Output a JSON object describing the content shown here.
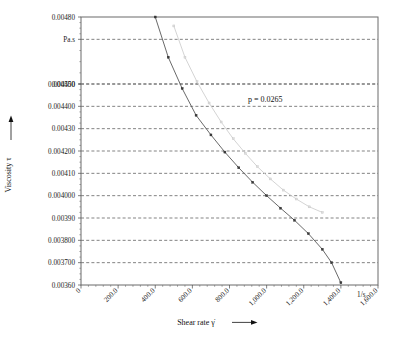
{
  "chart_data": {
    "type": "scatter",
    "title": "",
    "xlabel": "Shear rate γ̇",
    "ylabel": "Viscosity τ",
    "x_unit": "1/s",
    "y_unit": "Pa.s",
    "xlim": [
      0,
      1600
    ],
    "ylim": [
      0.0036,
      0.0048
    ],
    "grid": true,
    "legend": "none",
    "x_ticks": [
      0,
      200,
      400,
      600,
      800,
      1000,
      1200,
      1400,
      1600
    ],
    "x_tick_labels": [
      "0",
      "200.0",
      "400.0",
      "600.0",
      "800.0",
      "1,000.0",
      "1,200.0",
      "1,400.0",
      "1,600.0"
    ],
    "y_ticks": [
      0.0048,
      0.0047,
      0.0045,
      0.0045,
      0.0044,
      0.0043,
      0.0042,
      0.0041,
      0.004,
      0.0039,
      0.0038,
      0.0037,
      0.0036
    ],
    "y_tick_labels": [
      "0.00480",
      "Pa.s",
      "0.004500",
      "0.00450",
      "0.004400",
      "0.00430",
      "0.004200",
      "0.00410",
      "0.004000",
      "0.00390",
      "0.003800",
      "0.003700",
      "0.00360"
    ],
    "annotations": [
      {
        "text": "p = 0.0265",
        "x": 900,
        "y": 0.00442
      }
    ],
    "series": [
      {
        "name": "down-ramp",
        "color": "#585858",
        "marker": "filled-square",
        "points": [
          {
            "x": 400,
            "y": 0.0048
          },
          {
            "x": 470,
            "y": 0.00462
          },
          {
            "x": 545,
            "y": 0.00448
          },
          {
            "x": 620,
            "y": 0.00436
          },
          {
            "x": 700,
            "y": 0.004272
          },
          {
            "x": 775,
            "y": 0.004195
          },
          {
            "x": 850,
            "y": 0.004125
          },
          {
            "x": 925,
            "y": 0.00406
          },
          {
            "x": 1000,
            "y": 0.004
          },
          {
            "x": 1075,
            "y": 0.003944
          },
          {
            "x": 1150,
            "y": 0.00389
          },
          {
            "x": 1225,
            "y": 0.00383
          },
          {
            "x": 1300,
            "y": 0.00376
          },
          {
            "x": 1350,
            "y": 0.0037
          },
          {
            "x": 1400,
            "y": 0.00361
          }
        ]
      },
      {
        "name": "up-ramp",
        "color": "#d4d4d4",
        "marker": "open-square",
        "points": [
          {
            "x": 500,
            "y": 0.00476
          },
          {
            "x": 560,
            "y": 0.00462
          },
          {
            "x": 625,
            "y": 0.00451
          },
          {
            "x": 690,
            "y": 0.004415
          },
          {
            "x": 755,
            "y": 0.00433
          },
          {
            "x": 820,
            "y": 0.004255
          },
          {
            "x": 885,
            "y": 0.00419
          },
          {
            "x": 950,
            "y": 0.00413
          },
          {
            "x": 1020,
            "y": 0.004075
          },
          {
            "x": 1090,
            "y": 0.004025
          },
          {
            "x": 1160,
            "y": 0.003985
          },
          {
            "x": 1230,
            "y": 0.00395
          },
          {
            "x": 1300,
            "y": 0.003925
          }
        ]
      }
    ]
  }
}
